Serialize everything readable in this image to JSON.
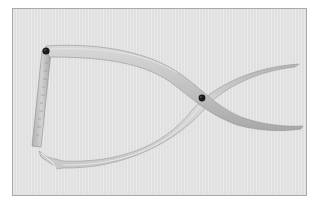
{
  "image": {
    "subject": "outside calipers with scale bar",
    "alt": "Metal outside calipers with crossed curved arms and a graduated scale arm on the left, photographed on a light gray background",
    "colors": {
      "background_page": "#ffffff",
      "photo_background": "#e4e4e4",
      "frame_border": "#a9a9a9",
      "metal_light": "#d6d6d6",
      "metal_mid": "#bcbcbc",
      "metal_dark": "#9a9a9a",
      "rivet": "#1a1a1a"
    },
    "elements": [
      {
        "name": "scale-arm",
        "description": "straight graduated bar on the left"
      },
      {
        "name": "hinge-rivet",
        "description": "black rivet at top-left joint"
      },
      {
        "name": "upper-arm",
        "description": "curved arm from hinge to lower-right tip"
      },
      {
        "name": "lower-arm",
        "description": "curved arm from lower-left tip to upper-right tip"
      },
      {
        "name": "pivot-rivet",
        "description": "black rivet where arms cross"
      }
    ]
  }
}
